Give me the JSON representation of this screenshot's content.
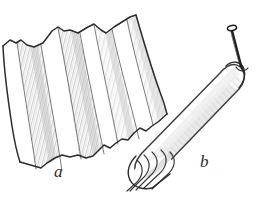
{
  "figure": {
    "kind": "hand-drawn line illustration",
    "caption_labels": [
      {
        "id": "a",
        "text": "a",
        "x": 54,
        "y": 163,
        "describes": "pleated fan-folded sheet of paper"
      },
      {
        "id": "b",
        "text": "b",
        "x": 200,
        "y": 153,
        "describes": "rolled paper tube pierced by a nail"
      }
    ],
    "colors": {
      "background": "#ffffff",
      "ink": "#2b2b2b",
      "outline_soft": "#4a4a4a",
      "hatch_light": "#cccccc",
      "hatch_mid": "#b3b3b3",
      "shade_fill": "#f2f2f2",
      "shade_fill_dark": "#dcdcdc",
      "nail_dark": "#1f1f1f"
    },
    "objects": [
      {
        "name": "pleated-sheet",
        "label": "a",
        "description": "Accordion / fan-folded sheet with torn zigzag top and bottom edges, four folded panels with diagonal hatch shading on the creased faces.",
        "fold_count": 4,
        "top_edge_points": "3,46 10,40 16,43 21,40 27,45 34,47 43,43 52,31 58,27 64,31 70,30 78,33 88,27 94,24 101,30 106,33 114,27 122,22 130,17 136,15",
        "bottom_edge_points": "20,162 27,164 34,166 41,168 47,163 55,158 62,155 70,157 78,155 86,158 93,156 99,150 104,145 110,148 116,143 122,139 128,140 134,133 140,128 146,131 152,126 158,122 164,118 167,114",
        "left_edge_points": "3,46 5,70 8,96 12,122 16,146 20,162",
        "right_edge_points": "136,15 145,40 152,62 159,86 165,106 167,114"
      },
      {
        "name": "rolled-tube",
        "label": "b",
        "description": "The same sheet rolled into a long tapering tube, rounded at the upper-right end, with the furled open end at lower-left showing several concentric rolled ridges.",
        "ridge_count": 5,
        "axis_from": "240,72",
        "axis_to": "138,178"
      },
      {
        "name": "nail",
        "description": "A nail with a rounded head at top, shaft angled down-right, point piercing the rounded end of the rolled tube.",
        "head_center": "233,28",
        "point": "242,68"
      }
    ]
  }
}
